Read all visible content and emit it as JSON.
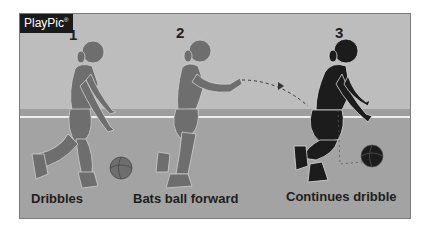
{
  "logo": {
    "text": "PlayPic",
    "mark": "®"
  },
  "steps": [
    {
      "number": "1",
      "caption": "Dribbles"
    },
    {
      "number": "2",
      "caption": "Bats ball forward"
    },
    {
      "number": "3",
      "caption": "Continues dribble"
    }
  ],
  "colors": {
    "figure_light": "#6e6e6e",
    "figure_dark": "#1c1c1c",
    "wall": "#bdbdbd",
    "floor": "#a3a3a3",
    "line": "#efefef"
  }
}
